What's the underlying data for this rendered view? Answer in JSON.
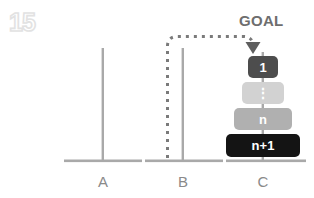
{
  "page": {
    "number": "15",
    "background": "#ffffff"
  },
  "annotation": {
    "goal_label": "GOAL",
    "arrow": {
      "from_peg": "B",
      "to_peg": "C",
      "style": "dotted",
      "color": "#7a7a7a",
      "arrowhead": "down-triangle"
    }
  },
  "pegs": [
    {
      "id": "A",
      "label": "A",
      "x": 103,
      "rod_visible": true,
      "discs": []
    },
    {
      "id": "B",
      "label": "B",
      "x": 183,
      "rod_visible": true,
      "discs": []
    },
    {
      "id": "C",
      "label": "C",
      "x": 263,
      "rod_visible": true,
      "discs": [
        {
          "label": "1",
          "color": "#4d4d4d",
          "text_color": "#ffffff",
          "width": 30,
          "height": 22,
          "font_size": 13
        },
        {
          "label": "⋮",
          "color": "#d2d2d2",
          "text_color": "#ffffff",
          "width": 42,
          "height": 22,
          "font_size": 14
        },
        {
          "label": "n",
          "color": "#b0b0b0",
          "text_color": "#ffffff",
          "width": 58,
          "height": 22,
          "font_size": 13
        },
        {
          "label": "n+1",
          "color": "#141414",
          "text_color": "#ffffff",
          "width": 74,
          "height": 23,
          "font_size": 13
        }
      ]
    }
  ],
  "colors": {
    "rod": "#a9a9a9",
    "base": "#a9a9a9",
    "label": "#8a8a8a",
    "goal_text": "#6e6e6e",
    "watermark": "#e2e2e2",
    "dotted_path": "#7a7a7a"
  }
}
